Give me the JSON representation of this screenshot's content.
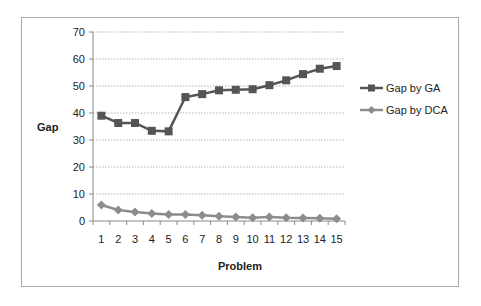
{
  "chart_data": {
    "type": "line",
    "title": "",
    "xlabel": "Problem",
    "ylabel": "Gap",
    "ylim": [
      0,
      70
    ],
    "yticks": [
      0,
      10,
      20,
      30,
      40,
      50,
      60,
      70
    ],
    "grid": true,
    "legend_position": "right",
    "categories": [
      "1",
      "2",
      "3",
      "4",
      "5",
      "6",
      "7",
      "8",
      "9",
      "10",
      "11",
      "12",
      "13",
      "14",
      "15"
    ],
    "series": [
      {
        "name": "Gap by GA",
        "marker": "square",
        "color": "#555555",
        "values": [
          39,
          36.3,
          36.3,
          33.4,
          33.2,
          45.9,
          47,
          48.4,
          48.6,
          48.8,
          50.3,
          52.1,
          54.4,
          56.4,
          57.4
        ]
      },
      {
        "name": "Gap by DCA",
        "marker": "diamond",
        "color": "#8c8c8c",
        "values": [
          5.9,
          4.1,
          3.3,
          2.8,
          2.4,
          2.4,
          2.1,
          1.8,
          1.5,
          1.2,
          1.5,
          1.2,
          1.1,
          1.0,
          0.8
        ]
      }
    ]
  },
  "labels": {
    "y_title": "Gap",
    "x_title": "Problem",
    "legend_ga": "Gap by GA",
    "legend_dca": "Gap by DCA"
  }
}
